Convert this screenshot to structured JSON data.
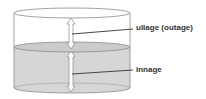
{
  "diagram": {
    "labels": {
      "ullage": "ullage (outage)",
      "innage": "innage"
    },
    "colors": {
      "tank_outline": "#8a8a8a",
      "liquid_fill": "#d6d6d6",
      "liquid_surface": "#c8c8c8",
      "arrow_fill": "#ffffff",
      "arrow_stroke": "#8a8a8a",
      "leader_line": "#333333",
      "text": "#333333"
    }
  }
}
